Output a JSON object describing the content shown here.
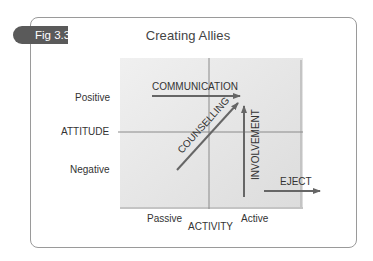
{
  "figure": {
    "tab_label": "Fig 3.3",
    "title": "Creating Allies"
  },
  "axes": {
    "y_axis_label": "ATTITUDE",
    "y_high_label": "Positive",
    "y_low_label": "Negative",
    "x_axis_label": "ACTIVITY",
    "x_low_label": "Passive",
    "x_high_label": "Active"
  },
  "arrows": [
    {
      "id": "communication",
      "label": "COMMUNICATION",
      "direction": "right"
    },
    {
      "id": "counselling",
      "label": "COUNSELLING",
      "direction": "up-right"
    },
    {
      "id": "involvement",
      "label": "INVOLVEMENT",
      "direction": "up"
    },
    {
      "id": "eject",
      "label": "EJECT",
      "direction": "right"
    }
  ],
  "colors": {
    "tab_fill": "#5a5a5a",
    "frame_border": "#9a9a9a",
    "grid_fill": "#e6e6e6",
    "arrow": "#666666"
  }
}
